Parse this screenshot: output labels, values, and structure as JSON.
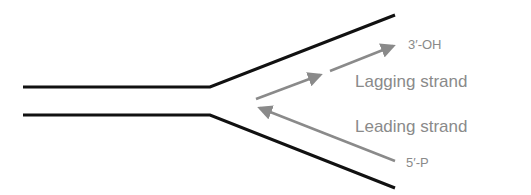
{
  "diagram": {
    "labels": {
      "three_prime": "3′-OH",
      "lagging": "Lagging strand",
      "leading": "Leading strand",
      "five_prime": "5′-P"
    },
    "colors": {
      "parental_strand": "#111111",
      "new_strand": "#8a8a8a",
      "label_text": "#8a8a8a"
    }
  }
}
